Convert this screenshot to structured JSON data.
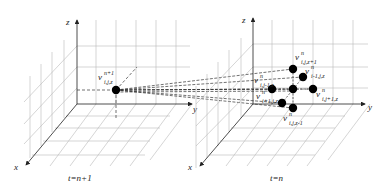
{
  "figure": {
    "type": "3D grid velocity interpolation diagram",
    "colors": {
      "grid": "#b0b0b0",
      "axis": "#222222",
      "node": "#000000",
      "dash": "#333333",
      "background": "#ffffff"
    }
  },
  "left_panel": {
    "caption": "t=n+1",
    "axes": {
      "x": "x",
      "y": "y",
      "z": "z"
    },
    "node": {
      "base": "v",
      "sup": "n+1",
      "sub": "i,j,z"
    }
  },
  "right_panel": {
    "caption": "t=n",
    "axes": {
      "x": "x",
      "y": "y",
      "z": "z"
    },
    "nodes": [
      {
        "id": "top",
        "base": "v",
        "sup": "n",
        "sub": "i,j,z+1"
      },
      {
        "id": "back",
        "base": "v",
        "sup": "n",
        "sub": "i-1,j,z"
      },
      {
        "id": "left",
        "base": "v",
        "sup": "n",
        "sub": "i,j-1,z"
      },
      {
        "id": "center",
        "base": "v",
        "sup": "n",
        "sub": "i,j,z"
      },
      {
        "id": "right",
        "base": "v",
        "sup": "n",
        "sub": "i,j+1,z"
      },
      {
        "id": "front",
        "base": "v",
        "sup": "n",
        "sub": "i+1,j,z"
      },
      {
        "id": "bottom",
        "base": "v",
        "sup": "n",
        "sub": "i,j,z-1"
      }
    ]
  }
}
